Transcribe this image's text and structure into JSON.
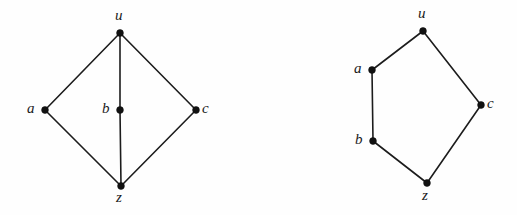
{
  "figure": {
    "background_color": "#fefefe",
    "ink_color": "#1c1c1c",
    "vertex_color": "#111111",
    "width": 517,
    "height": 215
  },
  "chart_data": {
    "type": "diagram",
    "diagram_type": "graph-drawing-pair",
    "title": "",
    "graphs": [
      {
        "id": "left-graph",
        "name": "diamond-graph-with-midpoint-b",
        "vertices": [
          {
            "id": "u",
            "label": "u",
            "x": 120,
            "y": 33,
            "label_x": 115,
            "label_y": 8,
            "label_anchor": "above"
          },
          {
            "id": "a",
            "label": "a",
            "x": 45,
            "y": 110,
            "label_x": 27,
            "label_y": 101,
            "label_anchor": "left"
          },
          {
            "id": "b",
            "label": "b",
            "x": 120,
            "y": 110,
            "label_x": 102,
            "label_y": 101,
            "label_anchor": "left"
          },
          {
            "id": "c",
            "label": "c",
            "x": 196,
            "y": 110,
            "label_x": 202,
            "label_y": 101,
            "label_anchor": "right"
          },
          {
            "id": "z",
            "label": "z",
            "x": 121,
            "y": 186,
            "label_x": 116,
            "label_y": 190,
            "label_anchor": "below"
          }
        ],
        "edges": [
          {
            "from": "u",
            "to": "a"
          },
          {
            "from": "u",
            "to": "c"
          },
          {
            "from": "u",
            "to": "b"
          },
          {
            "from": "b",
            "to": "z"
          },
          {
            "from": "a",
            "to": "z"
          },
          {
            "from": "c",
            "to": "z"
          }
        ]
      },
      {
        "id": "right-graph",
        "name": "pentagon-cycle-graph",
        "vertices": [
          {
            "id": "u",
            "label": "u",
            "x": 423,
            "y": 31,
            "label_x": 418,
            "label_y": 6,
            "label_anchor": "above"
          },
          {
            "id": "a",
            "label": "a",
            "x": 372,
            "y": 70,
            "label_x": 354,
            "label_y": 61,
            "label_anchor": "left"
          },
          {
            "id": "c",
            "label": "c",
            "x": 481,
            "y": 105,
            "label_x": 487,
            "label_y": 96,
            "label_anchor": "right"
          },
          {
            "id": "b",
            "label": "b",
            "x": 373,
            "y": 141,
            "label_x": 355,
            "label_y": 132,
            "label_anchor": "left"
          },
          {
            "id": "z",
            "label": "z",
            "x": 427,
            "y": 183,
            "label_x": 422,
            "label_y": 188,
            "label_anchor": "below"
          }
        ],
        "edges": [
          {
            "from": "u",
            "to": "a"
          },
          {
            "from": "u",
            "to": "c"
          },
          {
            "from": "a",
            "to": "b"
          },
          {
            "from": "b",
            "to": "z"
          },
          {
            "from": "c",
            "to": "z"
          }
        ]
      }
    ]
  }
}
